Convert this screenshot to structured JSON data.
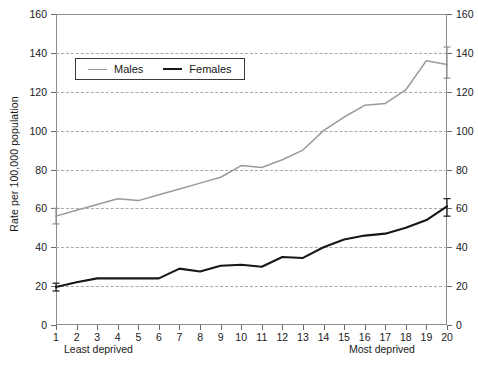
{
  "chart_data": {
    "type": "line",
    "title": "",
    "subtitle": "",
    "xlabel": "",
    "ylabel": "Rate per 100,000 population",
    "xlim": [
      1,
      20
    ],
    "ylim": [
      0,
      160
    ],
    "grid": "horizontal-dashed",
    "legend_position": "upper-left-inside",
    "dual_y_axis": true,
    "x_tick_labels": [
      "1",
      "2",
      "3",
      "4",
      "5",
      "6",
      "7",
      "8",
      "9",
      "10",
      "11",
      "12",
      "13",
      "14",
      "15",
      "16",
      "17",
      "18",
      "19",
      "20"
    ],
    "y_tick_labels": [
      "0",
      "20",
      "40",
      "60",
      "80",
      "100",
      "120",
      "140",
      "160"
    ],
    "y_ticks": [
      0,
      20,
      40,
      60,
      80,
      100,
      120,
      140,
      160
    ],
    "x": [
      1,
      2,
      3,
      4,
      5,
      6,
      7,
      8,
      9,
      10,
      11,
      12,
      13,
      14,
      15,
      16,
      17,
      18,
      19,
      20
    ],
    "annotations": [
      {
        "text": "Least deprived",
        "position": "below-axis-left"
      },
      {
        "text": "Most deprived",
        "position": "below-axis-right"
      }
    ],
    "series": [
      {
        "name": "Males",
        "color": "#9a9a9a",
        "values": [
          56,
          59,
          62,
          65,
          64,
          67,
          70,
          73,
          76,
          82,
          81,
          85,
          90,
          100,
          107,
          113,
          114,
          121,
          136,
          134
        ],
        "error_bars": [
          {
            "x": 1,
            "low": 52,
            "high": 60
          },
          {
            "x": 20,
            "low": 127,
            "high": 143
          }
        ]
      },
      {
        "name": "Females",
        "color": "#171717",
        "values": [
          19.5,
          22,
          24,
          24,
          24,
          24,
          29,
          27.5,
          30.5,
          31,
          30,
          35,
          34.5,
          40,
          44,
          46,
          47,
          50,
          54,
          61
        ],
        "error_bars": [
          {
            "x": 1,
            "low": 17.5,
            "high": 21.5
          },
          {
            "x": 20,
            "low": 56,
            "high": 65
          }
        ]
      }
    ]
  },
  "legend": {
    "males_label": "Males",
    "females_label": "Females"
  },
  "axes": {
    "y_axis_title": "Rate per 100,000 population",
    "least_deprived_label": "Least deprived",
    "most_deprived_label": "Most deprived"
  }
}
